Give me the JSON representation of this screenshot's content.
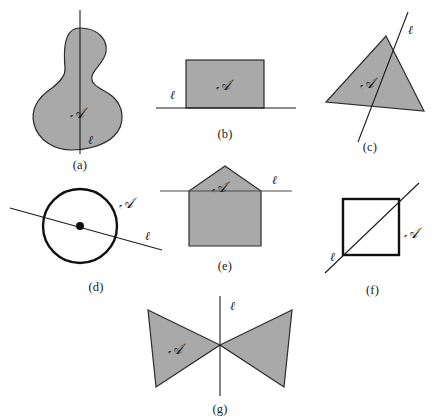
{
  "figure": {
    "background_color": "#ffffff",
    "shape_fill_color": "#a9a9a9",
    "shape_stroke_color": "#2b2b2b",
    "line_color": "#1c1c1c",
    "symbols": {
      "region_label": "ℬ",
      "region_label_alt": "𝒜",
      "line_label": "ℓ"
    },
    "panels": [
      {
        "id": "a",
        "caption": "(a)",
        "shape": "gourd-blob",
        "region_label": "𝒜",
        "line_label": "ℓ",
        "line_orientation": "vertical"
      },
      {
        "id": "b",
        "caption": "(b)",
        "shape": "rectangle",
        "region_label": "𝒜",
        "line_label": "ℓ",
        "line_orientation": "horizontal"
      },
      {
        "id": "c",
        "caption": "(c)",
        "shape": "triangle",
        "region_label": "𝒜",
        "line_label": "ℓ",
        "line_orientation": "oblique"
      },
      {
        "id": "d",
        "caption": "(d)",
        "shape": "circle",
        "region_label": "𝒜",
        "line_label": "ℓ",
        "line_orientation": "oblique-through-center"
      },
      {
        "id": "e",
        "caption": "(e)",
        "shape": "pentagon-house",
        "region_label": "𝒜",
        "line_label": "ℓ",
        "line_orientation": "horizontal"
      },
      {
        "id": "f",
        "caption": "(f)",
        "shape": "square",
        "region_label": "𝒜",
        "line_label": "ℓ",
        "line_orientation": "diagonal"
      },
      {
        "id": "g",
        "caption": "(g)",
        "shape": "bowtie",
        "region_label": "𝒜",
        "line_label": "ℓ",
        "line_orientation": "vertical"
      }
    ]
  }
}
